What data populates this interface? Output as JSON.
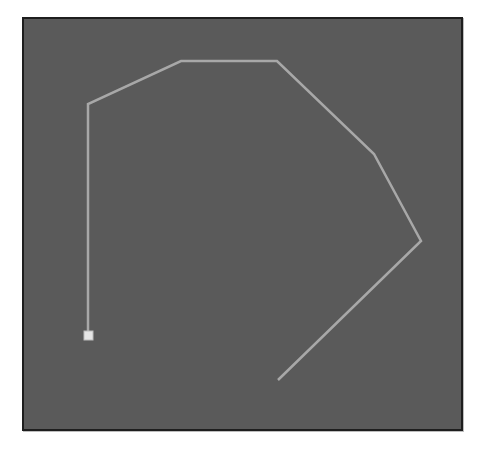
{
  "canvas": {
    "background": "#5a5a5a",
    "border_color": "#1e1e1e",
    "line_color": "#a8a8a8",
    "marker_color": "#e6e6e6"
  },
  "path": {
    "points": [
      [
        88,
        335
      ],
      [
        88,
        104
      ],
      [
        181,
        61
      ],
      [
        277,
        61
      ],
      [
        374,
        154
      ],
      [
        421,
        241
      ],
      [
        278,
        380
      ]
    ],
    "start_marker": [
      88,
      335
    ]
  }
}
